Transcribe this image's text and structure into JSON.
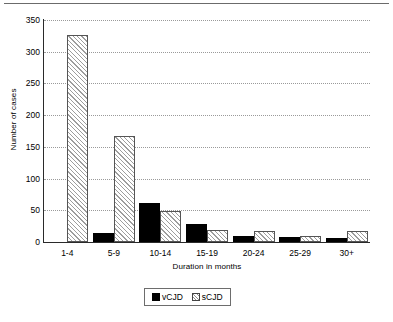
{
  "chart_data": {
    "type": "bar",
    "title": "",
    "xlabel": "Duration in months",
    "ylabel": "Number of cases",
    "categories": [
      "1-4",
      "5-9",
      "10-14",
      "15-19",
      "20-24",
      "25-29",
      "30+"
    ],
    "series": [
      {
        "name": "vCJD",
        "values": [
          0,
          14,
          61,
          28,
          10,
          8,
          6
        ],
        "color": "#000000",
        "fill": "solid"
      },
      {
        "name": "sCJD",
        "values": [
          326,
          167,
          49,
          19,
          17,
          9,
          17
        ],
        "color": "#ffffff",
        "fill": "diagonal-hatch"
      }
    ],
    "ylim": [
      0,
      350
    ],
    "ytick_values": [
      0,
      50,
      100,
      150,
      200,
      250,
      300,
      350
    ],
    "ytick_labels": [
      "0",
      "50",
      "100",
      "150",
      "200",
      "250",
      "300",
      "350"
    ],
    "grid": "horizontal-dotted",
    "legend_position": "below-axis-centered",
    "legend_entries": [
      "vCJD",
      "sCJD"
    ]
  },
  "figure": {
    "top_rule": "",
    "y_axis_title": "Number of cases",
    "x_axis_title": "Duration in months"
  }
}
